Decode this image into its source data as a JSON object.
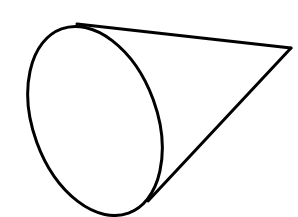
{
  "figure": {
    "stroke_color": "#000000",
    "background_color": "#ffffff",
    "base_ellipse": {
      "cx": 95,
      "cy": 121,
      "rx": 62,
      "ry": 98,
      "rotation_deg": -20
    },
    "apex": {
      "x": 291,
      "y": 48
    },
    "top_tangent_start": {
      "x": 77,
      "y": 24
    },
    "bottom_tangent_start": {
      "x": 148,
      "y": 201
    }
  }
}
